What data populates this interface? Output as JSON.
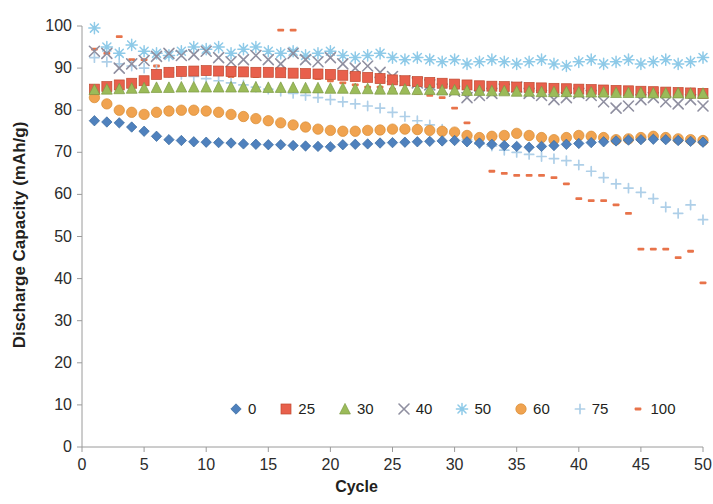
{
  "chart_data": {
    "type": "scatter",
    "title": "",
    "xlabel": "Cycle",
    "ylabel": "Discharge Capacity (mAh/g)",
    "xlim": [
      0,
      50
    ],
    "ylim": [
      0,
      100
    ],
    "xticks": [
      0,
      5,
      10,
      15,
      20,
      25,
      30,
      35,
      40,
      45,
      50
    ],
    "yticks": [
      0,
      10,
      20,
      30,
      40,
      50,
      60,
      70,
      80,
      90,
      100
    ],
    "grid": false,
    "legend_position": "inside-bottom-center",
    "x": [
      1,
      2,
      3,
      4,
      5,
      6,
      7,
      8,
      9,
      10,
      11,
      12,
      13,
      14,
      15,
      16,
      17,
      18,
      19,
      20,
      21,
      22,
      23,
      24,
      25,
      26,
      27,
      28,
      29,
      30,
      31,
      32,
      33,
      34,
      35,
      36,
      37,
      38,
      39,
      40,
      41,
      42,
      43,
      44,
      45,
      46,
      47,
      48,
      49,
      50
    ],
    "series": [
      {
        "name": "0",
        "label": "0",
        "marker": "diamond",
        "color": "#4f81bd",
        "values": [
          77.5,
          77.2,
          77.0,
          76.0,
          75.0,
          73.8,
          73.0,
          72.8,
          72.5,
          72.4,
          72.3,
          72.2,
          72.0,
          71.9,
          71.8,
          71.8,
          71.6,
          71.5,
          71.4,
          71.3,
          71.8,
          71.9,
          72.0,
          72.2,
          72.3,
          72.4,
          72.5,
          72.6,
          72.7,
          72.8,
          72.5,
          72.2,
          71.9,
          71.6,
          71.4,
          71.2,
          71.4,
          71.6,
          71.9,
          72.1,
          72.3,
          72.5,
          72.7,
          72.9,
          73.0,
          73.1,
          73.0,
          72.8,
          72.6,
          72.4
        ]
      },
      {
        "name": "25",
        "label": "25",
        "marker": "square",
        "color": "#e8604c",
        "values": [
          85.0,
          85.6,
          86.0,
          86.4,
          87.0,
          88.5,
          89.0,
          89.2,
          89.3,
          89.4,
          89.3,
          89.2,
          89.1,
          89.0,
          89.0,
          88.9,
          88.8,
          88.7,
          88.6,
          88.5,
          88.3,
          88.0,
          87.8,
          87.5,
          87.2,
          87.0,
          86.8,
          86.6,
          86.4,
          86.2,
          86.0,
          85.8,
          85.7,
          85.6,
          85.5,
          85.4,
          85.3,
          85.2,
          85.1,
          85.0,
          84.9,
          84.8,
          84.7,
          84.6,
          84.5,
          84.4,
          84.3,
          84.2,
          84.1,
          84.0
        ]
      },
      {
        "name": "30",
        "label": "30",
        "marker": "triangle",
        "color": "#9bbb59",
        "values": [
          84.9,
          85.0,
          85.1,
          85.2,
          85.3,
          85.4,
          85.4,
          85.5,
          85.5,
          85.5,
          85.5,
          85.5,
          85.5,
          85.5,
          85.4,
          85.4,
          85.4,
          85.3,
          85.3,
          85.2,
          85.2,
          85.1,
          85.1,
          85.0,
          85.0,
          85.0,
          84.9,
          84.9,
          84.8,
          84.8,
          84.7,
          84.7,
          84.6,
          84.6,
          84.5,
          84.5,
          84.4,
          84.4,
          84.4,
          84.3,
          84.3,
          84.3,
          84.2,
          84.2,
          84.2,
          84.1,
          84.1,
          84.1,
          84.0,
          84.0
        ]
      },
      {
        "name": "40",
        "label": "40",
        "marker": "x",
        "color": "#8f8fa0",
        "values": [
          94.0,
          93.5,
          90.0,
          91.0,
          91.8,
          92.8,
          93.5,
          93.0,
          93.2,
          94.0,
          92.5,
          91.5,
          92.0,
          93.0,
          92.0,
          91.0,
          93.5,
          92.0,
          91.5,
          92.5,
          91.0,
          90.0,
          90.5,
          89.0,
          88.0,
          87.0,
          86.5,
          86.0,
          85.0,
          84.5,
          83.0,
          83.5,
          84.0,
          85.0,
          85.5,
          84.0,
          83.5,
          82.5,
          83.0,
          84.0,
          83.5,
          82.0,
          80.5,
          81.0,
          82.5,
          83.0,
          82.0,
          81.5,
          82.5,
          81.0
        ]
      },
      {
        "name": "50",
        "label": "50",
        "marker": "asterisk",
        "color": "#8ecae8"
      },
      {
        "name": "60",
        "label": "60",
        "marker": "circle",
        "color": "#f0a350",
        "values": [
          83.0,
          81.5,
          80.0,
          79.5,
          79.0,
          79.5,
          79.8,
          80.0,
          80.0,
          79.8,
          79.5,
          79.0,
          78.5,
          78.0,
          77.5,
          77.0,
          76.5,
          76.0,
          75.5,
          75.2,
          75.0,
          75.0,
          75.2,
          75.3,
          75.5,
          75.5,
          75.4,
          75.2,
          75.0,
          74.8,
          74.0,
          73.5,
          73.8,
          74.0,
          74.5,
          74.0,
          73.5,
          73.0,
          73.5,
          74.0,
          73.8,
          73.5,
          73.0,
          73.2,
          73.5,
          73.8,
          73.5,
          73.2,
          73.0,
          72.8
        ]
      },
      {
        "name": "75",
        "label": "75",
        "marker": "plus",
        "color": "#aecfe8",
        "values": [
          92.5,
          91.5,
          91.0,
          90.5,
          90.0,
          89.5,
          89.0,
          88.5,
          88.0,
          87.5,
          87.0,
          86.5,
          86.0,
          85.5,
          85.0,
          84.5,
          84.0,
          83.5,
          83.0,
          82.5,
          82.0,
          81.5,
          81.0,
          80.5,
          79.5,
          78.5,
          77.5,
          76.5,
          75.5,
          74.5,
          73.0,
          72.0,
          71.5,
          70.5,
          70.0,
          69.5,
          69.0,
          68.5,
          68.0,
          67.0,
          65.5,
          64.0,
          62.5,
          61.5,
          60.5,
          59.0,
          57.0,
          55.5,
          57.5,
          54.0
        ]
      },
      {
        "name": "100",
        "label": "100",
        "marker": "dash",
        "color": "#e8734a",
        "values": [
          94.5,
          93.5,
          97.5,
          92.0,
          92.0,
          90.5,
          89.5,
          90.0,
          89.5,
          89.0,
          88.5,
          88.0,
          88.5,
          88.0,
          88.5,
          99.0,
          99.0,
          88.0,
          87.5,
          87.0,
          86.5,
          86.0,
          85.5,
          85.5,
          85.0,
          84.5,
          84.0,
          83.5,
          83.0,
          80.5,
          77.0,
          73.0,
          65.5,
          65.0,
          64.5,
          64.5,
          64.5,
          64.0,
          62.5,
          59.0,
          58.5,
          58.5,
          57.5,
          55.5,
          47.0,
          47.0,
          47.0,
          45.0,
          46.5,
          39.0
        ]
      }
    ],
    "series50_values": [
      99.5,
      95.0,
      93.5,
      95.5,
      94.0,
      93.5,
      93.0,
      94.0,
      95.0,
      94.5,
      95.0,
      93.5,
      94.5,
      95.0,
      94.0,
      93.5,
      94.0,
      93.0,
      93.5,
      94.0,
      93.0,
      92.5,
      93.0,
      93.5,
      92.5,
      92.0,
      92.5,
      92.0,
      91.5,
      92.0,
      91.0,
      91.5,
      92.0,
      91.5,
      91.0,
      91.5,
      92.0,
      91.0,
      90.5,
      91.5,
      92.0,
      91.0,
      91.5,
      92.0,
      91.0,
      91.5,
      92.0,
      91.0,
      91.5,
      92.5
    ]
  },
  "legend": {
    "entries": [
      {
        "label": "0"
      },
      {
        "label": "25"
      },
      {
        "label": "30"
      },
      {
        "label": "40"
      },
      {
        "label": "50"
      },
      {
        "label": "60"
      },
      {
        "label": "75"
      },
      {
        "label": "100"
      }
    ]
  }
}
